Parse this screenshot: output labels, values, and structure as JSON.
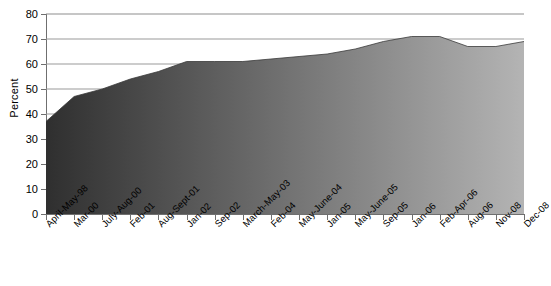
{
  "chart_data": {
    "type": "area",
    "title": "",
    "xlabel": "",
    "ylabel": "Percent",
    "ylim": [
      0,
      80
    ],
    "ytick_step": 10,
    "yticks": [
      0,
      10,
      20,
      30,
      40,
      50,
      60,
      70,
      80
    ],
    "grid": true,
    "grid_axis": "y",
    "legend": false,
    "categories": [
      "April-May-98",
      "Mar-00",
      "July-Aug-00",
      "Feb-01",
      "Aug-Sept-01",
      "Jan-02",
      "Sep-02",
      "March-May-03",
      "Feb-04",
      "May-June-04",
      "Jan-05",
      "May-June-05",
      "Sep-05",
      "Jan-06",
      "Feb-Apr-06",
      "Aug-06",
      "Nov-08",
      "Dec-08"
    ],
    "values": [
      37,
      47,
      50,
      54,
      57,
      61,
      61,
      61,
      62,
      63,
      64,
      66,
      69,
      71,
      71,
      67,
      67,
      69
    ],
    "series": [
      {
        "name": "Percent",
        "values": [
          37,
          47,
          50,
          54,
          57,
          61,
          61,
          61,
          62,
          63,
          64,
          66,
          69,
          71,
          71,
          67,
          67,
          69
        ]
      }
    ],
    "colors": {
      "fill_start": "#2f2f2f",
      "fill_end": "#b4b4b4",
      "gridline": "#9a9a9a",
      "axis": "#6f6f6f",
      "background": "#ffffff",
      "text": "#000000"
    }
  }
}
